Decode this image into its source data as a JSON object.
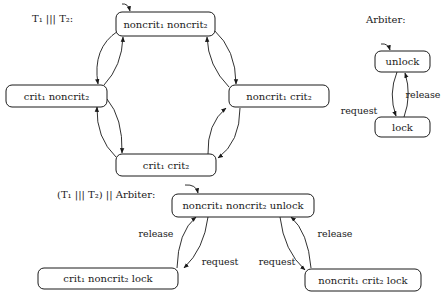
{
  "diagram": {
    "interleaving": {
      "title": "T₁ ||| T₂:",
      "nodes": [
        {
          "id": "nn",
          "label": "noncrit₁ noncrit₂",
          "initial": true
        },
        {
          "id": "cn",
          "label": "crit₁ noncrit₂"
        },
        {
          "id": "nc",
          "label": "noncrit₁ crit₂"
        },
        {
          "id": "cc",
          "label": "crit₁ crit₂"
        }
      ],
      "edges": [
        {
          "from": "nn",
          "to": "cn"
        },
        {
          "from": "cn",
          "to": "nn"
        },
        {
          "from": "nn",
          "to": "nc"
        },
        {
          "from": "nc",
          "to": "nn"
        },
        {
          "from": "cn",
          "to": "cc"
        },
        {
          "from": "cc",
          "to": "cn"
        },
        {
          "from": "nc",
          "to": "cc"
        },
        {
          "from": "cc",
          "to": "nc"
        }
      ]
    },
    "arbiter": {
      "title": "Arbiter:",
      "nodes": [
        {
          "id": "unlock",
          "label": "unlock",
          "initial": true
        },
        {
          "id": "lock",
          "label": "lock"
        }
      ],
      "edges": [
        {
          "from": "unlock",
          "to": "lock",
          "label": "request"
        },
        {
          "from": "lock",
          "to": "unlock",
          "label": "release"
        }
      ]
    },
    "composition": {
      "title": "(T₁ ||| T₂) || Arbiter:",
      "nodes": [
        {
          "id": "nnu",
          "label": "noncrit₁ noncrit₂ unlock",
          "initial": true
        },
        {
          "id": "cnl",
          "label": "crit₁ noncrit₂ lock"
        },
        {
          "id": "ncl",
          "label": "noncrit₁ crit₂ lock"
        }
      ],
      "edges": [
        {
          "from": "nnu",
          "to": "cnl",
          "label": "request"
        },
        {
          "from": "cnl",
          "to": "nnu",
          "label": "release"
        },
        {
          "from": "nnu",
          "to": "ncl",
          "label": "request"
        },
        {
          "from": "ncl",
          "to": "nnu",
          "label": "release"
        }
      ]
    }
  }
}
